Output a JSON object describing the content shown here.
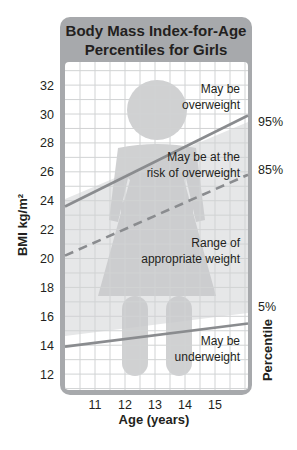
{
  "chart_data": {
    "type": "line",
    "title": "Body Mass Index-for-Age Percentiles for Girls",
    "title_lines": [
      "Body Mass Index-for-Age",
      "Percentiles for Girls"
    ],
    "xlabel": "Age (years)",
    "ylabel": "BMI kg/m²",
    "ylabel_right": "Percentile",
    "x_ticks": [
      "11",
      "12",
      "13",
      "14",
      "15"
    ],
    "y_ticks": [
      "12",
      "14",
      "16",
      "18",
      "20",
      "22",
      "24",
      "26",
      "28",
      "30",
      "32"
    ],
    "xlim": [
      10,
      16.1
    ],
    "ylim": [
      10.9,
      33.6
    ],
    "grid": true,
    "series": [
      {
        "name": "95%",
        "style": "solid",
        "x": [
          10,
          16.1
        ],
        "values": [
          23.6,
          29.9
        ]
      },
      {
        "name": "85%",
        "style": "dashed",
        "x": [
          10,
          16.1
        ],
        "values": [
          20.2,
          25.8
        ]
      },
      {
        "name": "5%",
        "style": "solid",
        "x": [
          10,
          16.1
        ],
        "values": [
          13.9,
          15.5
        ]
      }
    ],
    "zones": [
      {
        "label_lines": [
          "May be",
          "overweight"
        ]
      },
      {
        "label_lines": [
          "May be at the",
          "risk of overweight"
        ]
      },
      {
        "label_lines": [
          "Range of",
          "appropriate weight"
        ]
      },
      {
        "label_lines": [
          "May be",
          "underweight"
        ]
      }
    ],
    "colors": {
      "frame": "#a7a9ac",
      "header": "#a7a9ac",
      "line": "#8a8c8f",
      "silhouette": "#c8c9cb",
      "normal_band": "#e6e7e8",
      "grid": "#d1d3d4"
    }
  }
}
